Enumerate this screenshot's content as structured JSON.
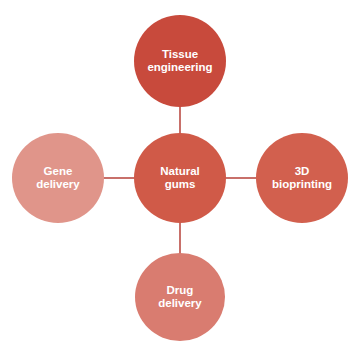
{
  "diagram": {
    "type": "hub-and-spoke",
    "center": {
      "label_line1": "Natural",
      "label_line2": "gums",
      "color": "#d05a48"
    },
    "nodes": {
      "top": {
        "label_line1": "Tissue",
        "label_line2": "engineering",
        "color": "#c84a3c"
      },
      "right": {
        "label_line1": "3D",
        "label_line2": "bioprinting",
        "color": "#d2604e"
      },
      "bottom": {
        "label_line1": "Drug",
        "label_line2": "delivery",
        "color": "#d97c70"
      },
      "left": {
        "label_line1": "Gene",
        "label_line2": "delivery",
        "color": "#e0958a"
      }
    },
    "connector_color": "#c8706a"
  }
}
